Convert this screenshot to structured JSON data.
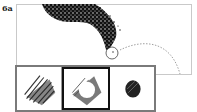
{
  "figure": {
    "label": "6a"
  },
  "swatches": [
    {
      "name": "solid-brush",
      "selected": false
    },
    {
      "name": "ring-brush",
      "selected": true
    },
    {
      "name": "small-round-brush",
      "selected": false
    }
  ],
  "colors": {
    "ink": "#111111",
    "frame": "#c9c9c9",
    "strip_border": "#7a7a7a",
    "selected_border": "#111111"
  }
}
